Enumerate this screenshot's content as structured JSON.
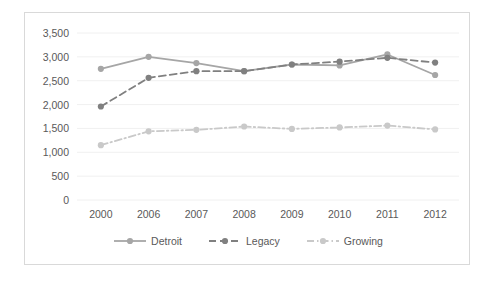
{
  "chart_data": {
    "type": "line",
    "title": "",
    "subtitle": "",
    "xlabel": "",
    "ylabel": "",
    "categories": [
      "2000",
      "2006",
      "2007",
      "2008",
      "2009",
      "2010",
      "2011",
      "2012"
    ],
    "ylim": [
      0,
      3500
    ],
    "yticks": [
      "0",
      "500",
      "1,000",
      "1,500",
      "2,000",
      "2,500",
      "3,000",
      "3,500"
    ],
    "ytick_values": [
      0,
      500,
      1000,
      1500,
      2000,
      2500,
      3000,
      3500
    ],
    "grid": true,
    "grid_axis": "y",
    "legend_position": "bottom",
    "series": [
      {
        "name": "Detroit",
        "color": "#a6a6a6",
        "style": "solid",
        "marker": "circle",
        "values": [
          2750,
          3000,
          2870,
          2700,
          2840,
          2820,
          3050,
          2620
        ]
      },
      {
        "name": "Legacy",
        "color": "#808080",
        "style": "dashed",
        "marker": "circle",
        "values": [
          1960,
          2560,
          2700,
          2700,
          2840,
          2900,
          2980,
          2880
        ]
      },
      {
        "name": "Growing",
        "color": "#c9c9c9",
        "style": "dashdot",
        "marker": "circle",
        "values": [
          1150,
          1440,
          1470,
          1540,
          1490,
          1520,
          1560,
          1480
        ]
      }
    ]
  },
  "legend": {
    "items": [
      {
        "label": "Detroit",
        "color": "#a6a6a6",
        "style": "solid"
      },
      {
        "label": "Legacy",
        "color": "#808080",
        "style": "dashed"
      },
      {
        "label": "Growing",
        "color": "#c9c9c9",
        "style": "dashdot"
      }
    ]
  },
  "colors": {
    "detroit": "#a6a6a6",
    "legacy": "#808080",
    "growing": "#c9c9c9",
    "gridline": "#f0f0f0",
    "border": "#d9d9d9",
    "text": "#595959"
  }
}
